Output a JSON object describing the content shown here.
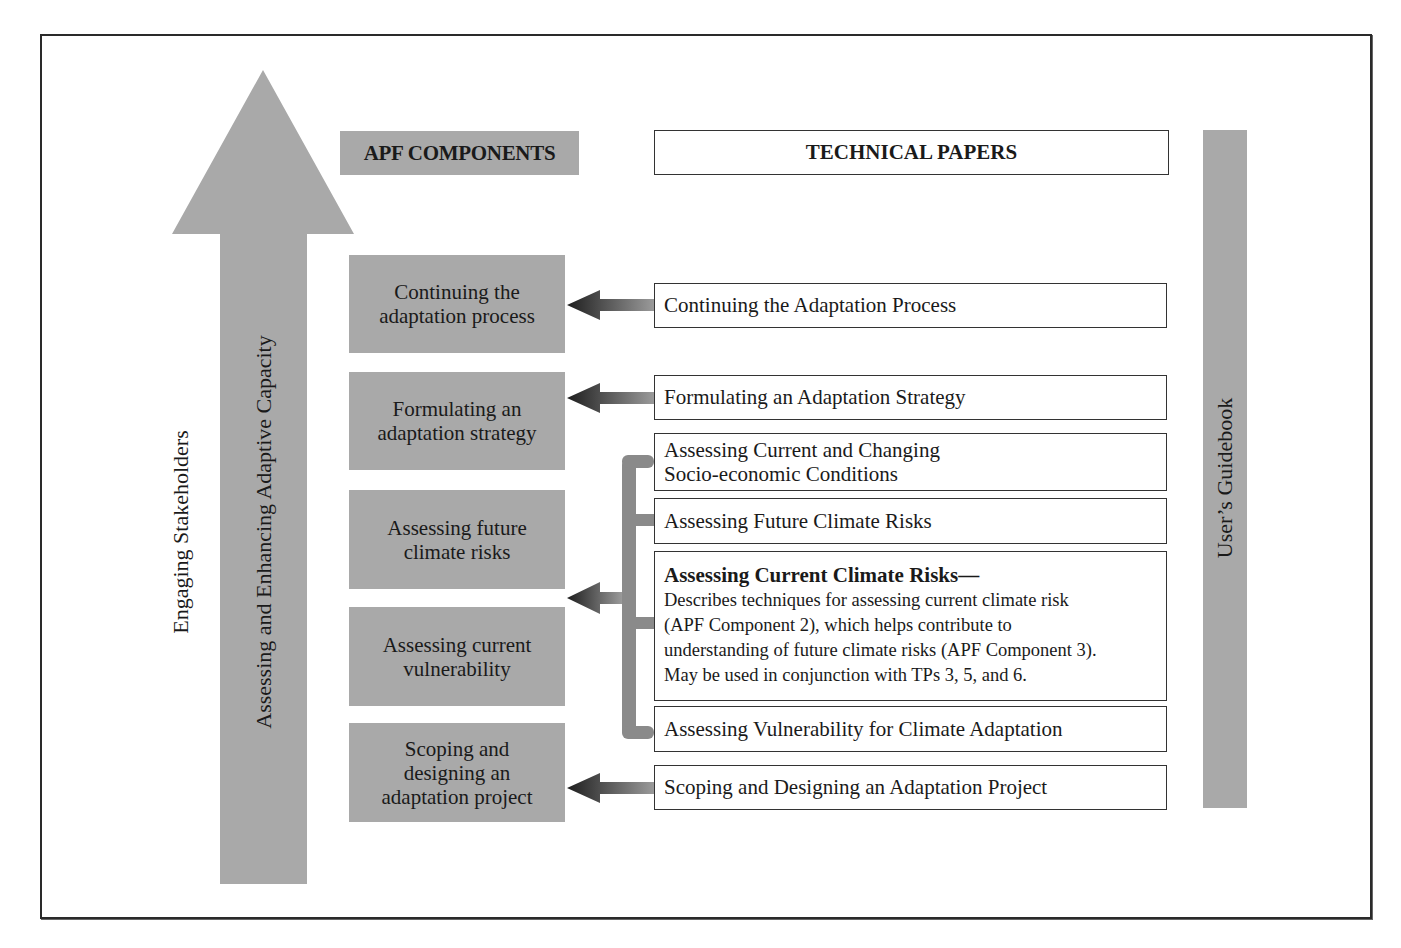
{
  "diagram": {
    "left_labels": {
      "outer": "Engaging Stakeholders",
      "big_arrow": "Assessing and Enhancing Adaptive Capacity"
    },
    "headers": {
      "components": "APF COMPONENTS",
      "papers": "TECHNICAL PAPERS"
    },
    "right_bar": "User’s Guidebook",
    "components": [
      {
        "lines": [
          "Continuing the",
          "adaptation process"
        ]
      },
      {
        "lines": [
          "Formulating an",
          "adaptation strategy"
        ]
      },
      {
        "lines": [
          "Assessing future",
          "climate risks"
        ]
      },
      {
        "lines": [
          "Assessing current",
          "vulnerability"
        ]
      },
      {
        "lines": [
          "Scoping and",
          "designing an",
          "adaptation project"
        ]
      }
    ],
    "papers": [
      {
        "lines": [
          "Continuing the Adaptation Process"
        ]
      },
      {
        "lines": [
          "Formulating an Adaptation Strategy"
        ]
      },
      {
        "lines": [
          "Assessing Current and Changing",
          "Socio-economic Conditions"
        ]
      },
      {
        "lines": [
          "Assessing Future Climate Risks"
        ]
      },
      {
        "title": "Assessing Current Climate Risks—",
        "desc_lines": [
          "Describes techniques  for assessing current climate risk",
          "(APF Component 2), which helps contribute to",
          "understanding of future climate risks (APF Component 3).",
          "May be used in conjunction with TPs 3, 5, and 6."
        ]
      },
      {
        "lines": [
          "Assessing Vulnerability for Climate Adaptation"
        ]
      },
      {
        "lines": [
          "Scoping and Designing an Adaptation Project"
        ]
      }
    ],
    "colors": {
      "gray_fill": "#a9a9a9",
      "arrow_dark": "#2b2b2b",
      "border": "#333333"
    }
  }
}
